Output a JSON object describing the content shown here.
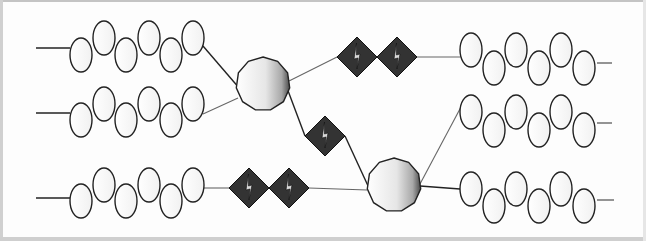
{
  "diagram": {
    "colors": {
      "background": "#ffffff",
      "frame": "#c8c8c8",
      "stroke": "#222222",
      "thin_line": "#666666",
      "diamond_fill": "#333333",
      "node_gradient_light": "#ffffff",
      "node_gradient_dark": "#555555"
    },
    "oval_size": {
      "rx": 11,
      "ry": 17
    },
    "chains": [
      {
        "id": "left-chain-1",
        "lead_in": [
          36,
          48,
          70,
          48
        ],
        "ovals_x": [
          81,
          104,
          126,
          149,
          171,
          193
        ],
        "y_low": 55,
        "y_high": 38,
        "first_low": true
      },
      {
        "id": "left-chain-2",
        "lead_in": [
          36,
          113,
          70,
          113
        ],
        "ovals_x": [
          81,
          104,
          126,
          149,
          171,
          193
        ],
        "y_low": 120,
        "y_high": 104,
        "first_low": true
      },
      {
        "id": "left-chain-3",
        "lead_in": [
          36,
          198,
          70,
          198
        ],
        "ovals_x": [
          81,
          104,
          126,
          149,
          171,
          193
        ],
        "y_low": 201,
        "y_high": 185,
        "first_low": true
      },
      {
        "id": "right-chain-1",
        "lead_out": [
          597,
          63,
          612,
          63
        ],
        "ovals_x": [
          471,
          494,
          516,
          539,
          561,
          584
        ],
        "y_low": 68,
        "y_high": 50,
        "first_low": false
      },
      {
        "id": "right-chain-2",
        "lead_out": [
          597,
          123,
          612,
          123
        ],
        "ovals_x": [
          471,
          494,
          516,
          539,
          561,
          584
        ],
        "y_low": 130,
        "y_high": 112,
        "first_low": false
      },
      {
        "id": "right-chain-3",
        "lead_out": [
          597,
          200,
          614,
          200
        ],
        "ovals_x": [
          471,
          494,
          516,
          539,
          561,
          584
        ],
        "y_low": 206,
        "y_high": 189,
        "first_low": false
      }
    ],
    "nodes": [
      {
        "id": "junction-node-1",
        "cx": 263,
        "cy": 84,
        "r": 27,
        "sides": 11
      },
      {
        "id": "junction-node-2",
        "cx": 394,
        "cy": 185,
        "r": 27,
        "sides": 11
      }
    ],
    "diamonds": [
      {
        "id": "diamond-top-1",
        "cx": 357,
        "cy": 57,
        "r": 20
      },
      {
        "id": "diamond-top-2",
        "cx": 397,
        "cy": 57,
        "r": 20
      },
      {
        "id": "diamond-mid",
        "cx": 325,
        "cy": 136,
        "r": 20
      },
      {
        "id": "diamond-bottom-1",
        "cx": 249,
        "cy": 188,
        "r": 20
      },
      {
        "id": "diamond-bottom-2",
        "cx": 289,
        "cy": 188,
        "r": 20
      }
    ],
    "connectors": [
      {
        "id": "chain1-to-node1",
        "points": [
          [
            203,
            46
          ],
          [
            240,
            89
          ]
        ],
        "weight": "thick"
      },
      {
        "id": "chain2-to-node1",
        "points": [
          [
            203,
            114
          ],
          [
            238,
            98
          ]
        ],
        "weight": "thin"
      },
      {
        "id": "node1-to-top-diamonds",
        "points": [
          [
            289,
            81
          ],
          [
            337,
            57
          ]
        ],
        "weight": "thin"
      },
      {
        "id": "top-diamonds-to-right1",
        "points": [
          [
            417,
            57
          ],
          [
            460,
            57
          ]
        ],
        "weight": "thin"
      },
      {
        "id": "node1-to-mid-diamond",
        "points": [
          [
            287,
            88
          ],
          [
            305,
            136
          ]
        ],
        "weight": "thick"
      },
      {
        "id": "mid-diamond-to-node2",
        "points": [
          [
            345,
            136
          ],
          [
            369,
            188
          ]
        ],
        "weight": "thick"
      },
      {
        "id": "chain3-to-bottom-diamonds",
        "points": [
          [
            203,
            188
          ],
          [
            229,
            188
          ]
        ],
        "weight": "thin"
      },
      {
        "id": "bottom-diamonds-to-node2",
        "points": [
          [
            309,
            188
          ],
          [
            367,
            190
          ]
        ],
        "weight": "thin"
      },
      {
        "id": "node2-to-right2",
        "points": [
          [
            420,
            184
          ],
          [
            461,
            107
          ]
        ],
        "weight": "thin"
      },
      {
        "id": "node2-to-right3",
        "points": [
          [
            420,
            186
          ],
          [
            460,
            189
          ]
        ],
        "weight": "thick"
      }
    ],
    "labels": []
  }
}
